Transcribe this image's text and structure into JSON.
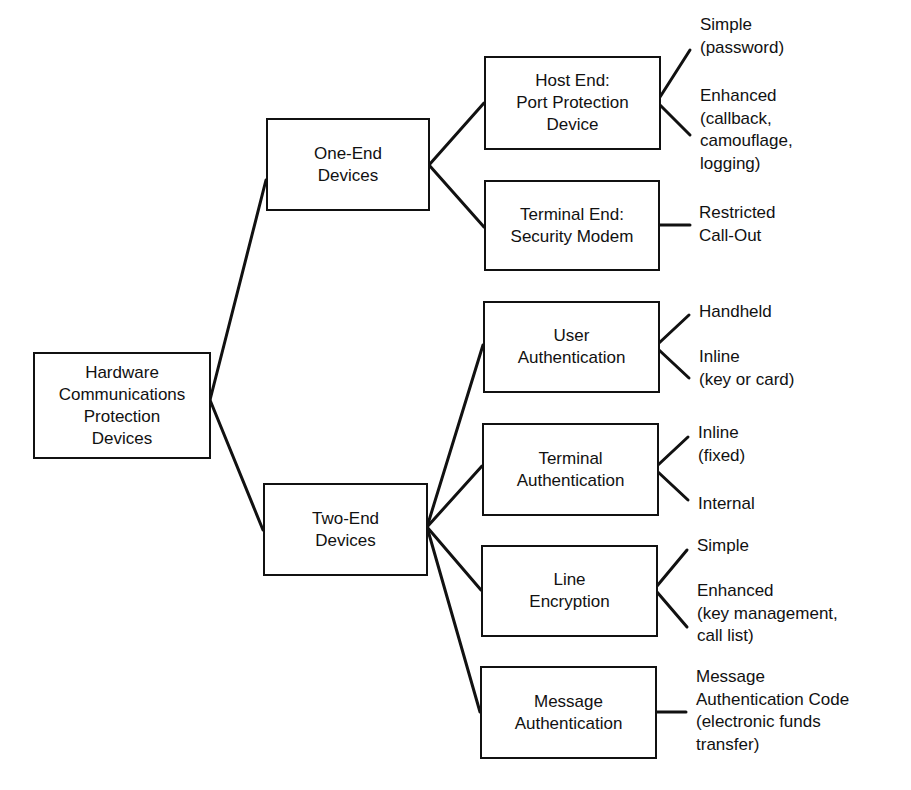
{
  "diagram": {
    "type": "tree",
    "stroke_color": "#111111",
    "background": "#ffffff",
    "root": {
      "id": "root",
      "lines": [
        "Hardware",
        "Communications",
        "Protection",
        "Devices"
      ]
    },
    "level1": [
      {
        "id": "one_end",
        "lines": [
          "One-End",
          "Devices"
        ]
      },
      {
        "id": "two_end",
        "lines": [
          "Two-End",
          "Devices"
        ]
      }
    ],
    "level2": [
      {
        "id": "host_end",
        "parent": "one_end",
        "lines": [
          "Host End:",
          "Port Protection",
          "Device"
        ]
      },
      {
        "id": "terminal_end",
        "parent": "one_end",
        "lines": [
          "Terminal End:",
          "Security Modem"
        ]
      },
      {
        "id": "user_auth",
        "parent": "two_end",
        "lines": [
          "User",
          "Authentication"
        ]
      },
      {
        "id": "terminal_auth",
        "parent": "two_end",
        "lines": [
          "Terminal",
          "Authentication"
        ]
      },
      {
        "id": "line_enc",
        "parent": "two_end",
        "lines": [
          "Line",
          "Encryption"
        ]
      },
      {
        "id": "msg_auth",
        "parent": "two_end",
        "lines": [
          "Message",
          "Authentication"
        ]
      }
    ],
    "leaves": [
      {
        "parent": "host_end",
        "lines": [
          "Simple",
          "(password)"
        ]
      },
      {
        "parent": "host_end",
        "lines": [
          "Enhanced",
          "(callback,",
          "camouflage,",
          "logging)"
        ]
      },
      {
        "parent": "terminal_end",
        "lines": [
          "Restricted",
          "Call-Out"
        ]
      },
      {
        "parent": "user_auth",
        "lines": [
          "Handheld"
        ]
      },
      {
        "parent": "user_auth",
        "lines": [
          "Inline",
          "(key or card)"
        ]
      },
      {
        "parent": "terminal_auth",
        "lines": [
          "Inline",
          "(fixed)"
        ]
      },
      {
        "parent": "terminal_auth",
        "lines": [
          "Internal"
        ]
      },
      {
        "parent": "line_enc",
        "lines": [
          "Simple"
        ]
      },
      {
        "parent": "line_enc",
        "lines": [
          "Enhanced",
          "(key management,",
          "call list)"
        ]
      },
      {
        "parent": "msg_auth",
        "lines": [
          "Message",
          "Authentication Code",
          "(electronic funds",
          "transfer)"
        ]
      }
    ]
  }
}
